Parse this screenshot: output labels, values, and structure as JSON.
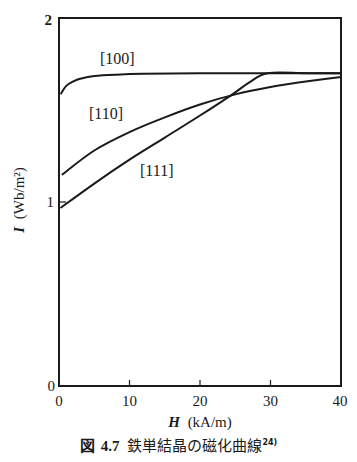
{
  "chart_data": {
    "type": "line",
    "title": "鉄単結晶の磁化曲線",
    "figure_number": "図 4.7",
    "reference": "24)",
    "xlabel": "H (kA/m)",
    "ylabel": "I (Wb/m²)",
    "xlim": [
      0,
      40
    ],
    "ylim": [
      0,
      2
    ],
    "x_ticks": [
      0,
      10,
      20,
      30,
      40
    ],
    "y_ticks": [
      0,
      1,
      2
    ],
    "grid": false,
    "legend": "inline labels",
    "series": [
      {
        "name": "[100]",
        "x": [
          0.3,
          1,
          2,
          3,
          5,
          8,
          12,
          20,
          30,
          40
        ],
        "values": [
          1.59,
          1.63,
          1.655,
          1.67,
          1.685,
          1.692,
          1.697,
          1.7,
          1.7,
          1.7
        ]
      },
      {
        "name": "[110]",
        "x": [
          0.5,
          5,
          10,
          15,
          20,
          25,
          30,
          35,
          40
        ],
        "values": [
          1.15,
          1.28,
          1.38,
          1.46,
          1.53,
          1.585,
          1.625,
          1.655,
          1.68
        ]
      },
      {
        "name": "[111]",
        "x": [
          0.3,
          5,
          10,
          15,
          20,
          24.4,
          27,
          29.6,
          35,
          40
        ],
        "values": [
          0.97,
          1.1,
          1.23,
          1.35,
          1.47,
          1.58,
          1.65,
          1.7,
          1.7,
          1.7
        ]
      }
    ]
  },
  "labels": {
    "y_axis_var": "I",
    "y_axis_unit": "(Wb/m²)",
    "x_axis_var": "H",
    "x_axis_unit": "(kA/m)",
    "series_100": "[100]",
    "series_110": "[110]",
    "series_111": "[111]",
    "tick_y_0": "0",
    "tick_y_1": "1",
    "tick_y_2": "2",
    "tick_x_0": "0",
    "tick_x_10": "10",
    "tick_x_20": "20",
    "tick_x_30": "30",
    "tick_x_40": "40"
  },
  "caption": {
    "prefix": "図",
    "number": "4.7",
    "text": "鉄単結晶の磁化曲線",
    "ref": "24)"
  }
}
